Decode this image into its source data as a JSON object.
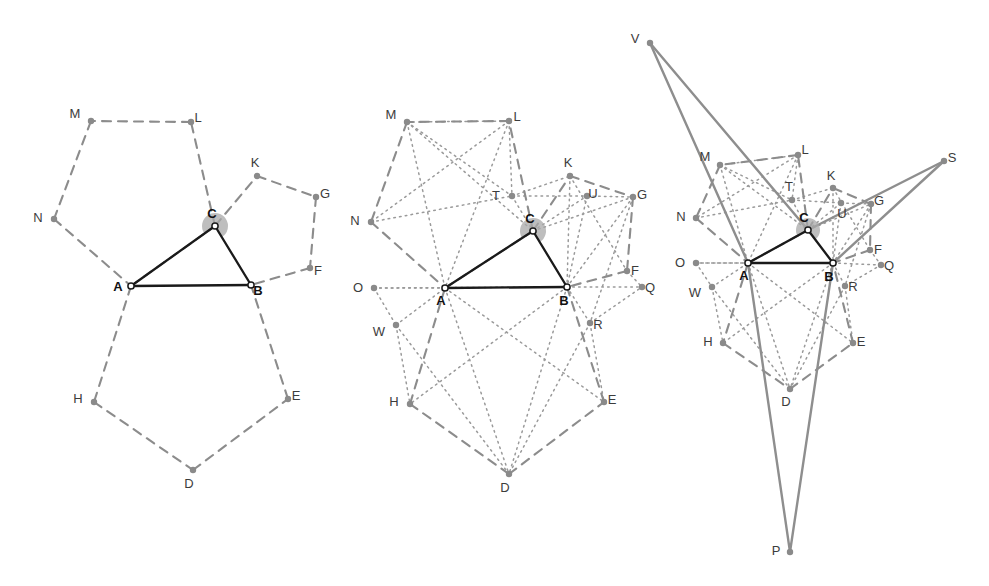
{
  "figure": {
    "background_color": "#ffffff",
    "colors": {
      "triangle_stroke": "#1a1a1a",
      "pentagon_dashed": "#8c8c8c",
      "dotted_line": "#9a9a9a",
      "solid_gray_line": "#8e8e8e",
      "vertex_fill": "#8a8a8a",
      "vertex_open_fill": "#ffffff",
      "angle_arc_fill": "#a8a8a8",
      "label_dark": "#111111",
      "label_gray": "#3c3c3c"
    },
    "line_styles": {
      "triangle": "solid-black-2.2px",
      "pentagon": "dashed-gray-2px",
      "diagonal": "dotted-gray-1.6px",
      "outer": "solid-gray-2.2px"
    }
  },
  "panels": [
    {
      "id": "panel-1",
      "name": "triangle-with-pentagons",
      "description": "Triangle ABC with regular pentagons erected outward on each side",
      "points": {
        "A": {
          "x": 131,
          "y": 286,
          "label": "A",
          "label_dx": -13,
          "label_dy": 5,
          "bold": true,
          "open": true
        },
        "B": {
          "x": 251,
          "y": 285,
          "label": "B",
          "label_dx": 7,
          "label_dy": 10,
          "bold": true,
          "open": true
        },
        "C": {
          "x": 215,
          "y": 226,
          "label": "C",
          "label_dx": -3,
          "label_dy": -8,
          "bold": true,
          "open": true
        },
        "D": {
          "x": 193,
          "y": 470,
          "label": "D",
          "label_dx": -4,
          "label_dy": 18,
          "bold": false,
          "open": false
        },
        "E": {
          "x": 288,
          "y": 399,
          "label": "E",
          "label_dx": 8,
          "label_dy": 1,
          "bold": false,
          "open": false
        },
        "F": {
          "x": 310,
          "y": 268,
          "label": "F",
          "label_dx": 8,
          "label_dy": 7,
          "bold": false,
          "open": false
        },
        "G": {
          "x": 316,
          "y": 197,
          "label": "G",
          "label_dx": 9,
          "label_dy": 1,
          "bold": false,
          "open": false
        },
        "H": {
          "x": 94,
          "y": 402,
          "label": "H",
          "label_dx": -16,
          "label_dy": 1,
          "bold": false,
          "open": false
        },
        "K": {
          "x": 257,
          "y": 176,
          "label": "K",
          "label_dx": -2,
          "label_dy": -9,
          "bold": false,
          "open": false
        },
        "L": {
          "x": 191,
          "y": 122,
          "label": "L",
          "label_dx": 7,
          "label_dy": 0,
          "bold": false,
          "open": false
        },
        "M": {
          "x": 91,
          "y": 121,
          "label": "M",
          "label_dx": -16,
          "label_dy": -3,
          "bold": false,
          "open": false
        },
        "N": {
          "x": 54,
          "y": 219,
          "label": "N",
          "label_dx": -16,
          "label_dy": 3,
          "bold": false,
          "open": false
        }
      },
      "triangle_edges": [
        [
          "A",
          "B"
        ],
        [
          "B",
          "C"
        ],
        [
          "C",
          "A"
        ]
      ],
      "dashed_paths": [
        [
          "A",
          "C",
          "L",
          "M",
          "N",
          "A"
        ],
        [
          "C",
          "K",
          "G",
          "F",
          "B"
        ],
        [
          "A",
          "H",
          "D",
          "E",
          "B"
        ]
      ],
      "dotted_paths": [],
      "solid_gray_paths": [],
      "angle_marks": [
        {
          "vertex": "C",
          "radius": 13
        }
      ]
    },
    {
      "id": "panel-2",
      "name": "pentagons-with-diagonals",
      "description": "Same construction with pentagon diagonals drawn as dotted lines, introducing points O, Q, R, T, U, W",
      "points": {
        "A": {
          "x": 445,
          "y": 288,
          "label": "A",
          "label_dx": -4,
          "label_dy": 17,
          "bold": true,
          "open": true
        },
        "B": {
          "x": 567,
          "y": 287,
          "label": "B",
          "label_dx": -3,
          "label_dy": 18,
          "bold": true,
          "open": true
        },
        "C": {
          "x": 533,
          "y": 231,
          "label": "C",
          "label_dx": -3,
          "label_dy": -8,
          "bold": true,
          "open": true
        },
        "D": {
          "x": 509,
          "y": 474,
          "label": "D",
          "label_dx": -4,
          "label_dy": 18,
          "bold": false,
          "open": false
        },
        "E": {
          "x": 604,
          "y": 402,
          "label": "E",
          "label_dx": 8,
          "label_dy": 2,
          "bold": false,
          "open": false
        },
        "F": {
          "x": 627,
          "y": 271,
          "label": "F",
          "label_dx": 8,
          "label_dy": 4,
          "bold": false,
          "open": false
        },
        "G": {
          "x": 633,
          "y": 197,
          "label": "G",
          "label_dx": 9,
          "label_dy": 2,
          "bold": false,
          "open": false
        },
        "H": {
          "x": 410,
          "y": 404,
          "label": "H",
          "label_dx": -16,
          "label_dy": 2,
          "bold": false,
          "open": false
        },
        "K": {
          "x": 570,
          "y": 176,
          "label": "K",
          "label_dx": -2,
          "label_dy": -9,
          "bold": false,
          "open": false
        },
        "L": {
          "x": 509,
          "y": 121,
          "label": "L",
          "label_dx": 8,
          "label_dy": 0,
          "bold": false,
          "open": false
        },
        "M": {
          "x": 407,
          "y": 122,
          "label": "M",
          "label_dx": -16,
          "label_dy": -3,
          "bold": false,
          "open": false
        },
        "N": {
          "x": 371,
          "y": 222,
          "label": "N",
          "label_dx": -16,
          "label_dy": 3,
          "bold": false,
          "open": false
        },
        "O": {
          "x": 374,
          "y": 288,
          "label": "O",
          "label_dx": -16,
          "label_dy": 4,
          "bold": false,
          "open": false
        },
        "Q": {
          "x": 642,
          "y": 287,
          "label": "Q",
          "label_dx": 8,
          "label_dy": 5,
          "bold": false,
          "open": false
        },
        "R": {
          "x": 590,
          "y": 323,
          "label": "R",
          "label_dx": 8,
          "label_dy": 6,
          "bold": false,
          "open": false
        },
        "T": {
          "x": 512,
          "y": 196,
          "label": "T",
          "label_dx": -16,
          "label_dy": 4,
          "bold": false,
          "open": false
        },
        "U": {
          "x": 587,
          "y": 196,
          "label": "U",
          "label_dx": 6,
          "label_dy": 2,
          "bold": false,
          "open": false
        },
        "W": {
          "x": 396,
          "y": 325,
          "label": "W",
          "label_dx": -17,
          "label_dy": 11,
          "bold": false,
          "open": false
        }
      },
      "triangle_edges": [
        [
          "A",
          "B"
        ],
        [
          "B",
          "C"
        ],
        [
          "C",
          "A"
        ]
      ],
      "dashed_paths": [
        [
          "A",
          "C",
          "L",
          "M",
          "N",
          "A"
        ],
        [
          "C",
          "K",
          "G",
          "F",
          "B"
        ],
        [
          "A",
          "H",
          "D",
          "E",
          "B"
        ]
      ],
      "dotted_paths": [
        [
          "M",
          "C"
        ],
        [
          "M",
          "A"
        ],
        [
          "L",
          "N"
        ],
        [
          "L",
          "A"
        ],
        [
          "M",
          "T"
        ],
        [
          "T",
          "U"
        ],
        [
          "T",
          "C"
        ],
        [
          "T",
          "K"
        ],
        [
          "C",
          "U"
        ],
        [
          "C",
          "G"
        ],
        [
          "K",
          "F"
        ],
        [
          "K",
          "B"
        ],
        [
          "U",
          "B"
        ],
        [
          "U",
          "G"
        ],
        [
          "G",
          "B"
        ],
        [
          "G",
          "R"
        ],
        [
          "F",
          "Q"
        ],
        [
          "B",
          "Q"
        ],
        [
          "B",
          "R"
        ],
        [
          "R",
          "Q"
        ],
        [
          "R",
          "E"
        ],
        [
          "R",
          "D"
        ],
        [
          "A",
          "O"
        ],
        [
          "O",
          "B"
        ],
        [
          "O",
          "W"
        ],
        [
          "W",
          "A"
        ],
        [
          "W",
          "H"
        ],
        [
          "W",
          "D"
        ],
        [
          "A",
          "D"
        ],
        [
          "A",
          "E"
        ],
        [
          "B",
          "D"
        ],
        [
          "B",
          "H"
        ],
        [
          "N",
          "T"
        ],
        [
          "L",
          "T"
        ],
        [
          "M",
          "L"
        ]
      ],
      "solid_gray_paths": [],
      "angle_marks": [
        {
          "vertex": "C",
          "radius": 13
        }
      ]
    },
    {
      "id": "panel-3",
      "name": "outer-napoleon-triangle",
      "description": "Full construction with apex points P, S, V joined to the triangle by solid gray lines",
      "points": {
        "A": {
          "x": 748,
          "y": 263,
          "label": "A",
          "label_dx": -4,
          "label_dy": 17,
          "bold": true,
          "open": true
        },
        "B": {
          "x": 833,
          "y": 263,
          "label": "B",
          "label_dx": -4,
          "label_dy": 18,
          "bold": true,
          "open": true
        },
        "C": {
          "x": 808,
          "y": 230,
          "label": "C",
          "label_dx": -4,
          "label_dy": -8,
          "bold": true,
          "open": true
        },
        "D": {
          "x": 790,
          "y": 389,
          "label": "D",
          "label_dx": -4,
          "label_dy": 17,
          "bold": false,
          "open": false
        },
        "E": {
          "x": 853,
          "y": 343,
          "label": "E",
          "label_dx": 8,
          "label_dy": 3,
          "bold": false,
          "open": false
        },
        "F": {
          "x": 870,
          "y": 250,
          "label": "F",
          "label_dx": 8,
          "label_dy": 4,
          "bold": false,
          "open": false
        },
        "G": {
          "x": 871,
          "y": 204,
          "label": "G",
          "label_dx": 8,
          "label_dy": 1,
          "bold": false,
          "open": false
        },
        "H": {
          "x": 723,
          "y": 343,
          "label": "H",
          "label_dx": -15,
          "label_dy": 3,
          "bold": false,
          "open": false
        },
        "K": {
          "x": 833,
          "y": 188,
          "label": "K",
          "label_dx": -2,
          "label_dy": -8,
          "bold": false,
          "open": false
        },
        "L": {
          "x": 798,
          "y": 155,
          "label": "L",
          "label_dx": 7,
          "label_dy": -1,
          "bold": false,
          "open": false
        },
        "M": {
          "x": 720,
          "y": 165,
          "label": "M",
          "label_dx": -15,
          "label_dy": -4,
          "bold": false,
          "open": false
        },
        "N": {
          "x": 696,
          "y": 218,
          "label": "N",
          "label_dx": -15,
          "label_dy": 3,
          "bold": false,
          "open": false
        },
        "O": {
          "x": 696,
          "y": 263,
          "label": "O",
          "label_dx": -16,
          "label_dy": 4,
          "bold": false,
          "open": false
        },
        "P": {
          "x": 790,
          "y": 552,
          "label": "P",
          "label_dx": -14,
          "label_dy": 3,
          "bold": false,
          "open": false
        },
        "Q": {
          "x": 881,
          "y": 265,
          "label": "Q",
          "label_dx": 8,
          "label_dy": 5,
          "bold": false,
          "open": false
        },
        "R": {
          "x": 845,
          "y": 286,
          "label": "R",
          "label_dx": 8,
          "label_dy": 5,
          "bold": false,
          "open": false
        },
        "S": {
          "x": 944,
          "y": 161,
          "label": "S",
          "label_dx": 8,
          "label_dy": 1,
          "bold": false,
          "open": false
        },
        "T": {
          "x": 792,
          "y": 200,
          "label": "T",
          "label_dx": -3,
          "label_dy": -9,
          "bold": false,
          "open": false
        },
        "U": {
          "x": 841,
          "y": 203,
          "label": "U",
          "label_dx": 1,
          "label_dy": 15,
          "bold": false,
          "open": false
        },
        "V": {
          "x": 650,
          "y": 43,
          "label": "V",
          "label_dx": -15,
          "label_dy": 0,
          "bold": false,
          "open": false
        },
        "W": {
          "x": 712,
          "y": 287,
          "label": "W",
          "label_dx": -17,
          "label_dy": 10,
          "bold": false,
          "open": false
        }
      },
      "triangle_edges": [
        [
          "A",
          "B"
        ],
        [
          "B",
          "C"
        ],
        [
          "C",
          "A"
        ]
      ],
      "dashed_paths": [
        [
          "A",
          "C",
          "L",
          "M",
          "N",
          "A"
        ],
        [
          "C",
          "K",
          "G",
          "F",
          "B"
        ],
        [
          "A",
          "H",
          "D",
          "E",
          "B"
        ]
      ],
      "dotted_paths": [
        [
          "M",
          "C"
        ],
        [
          "M",
          "A"
        ],
        [
          "L",
          "N"
        ],
        [
          "L",
          "A"
        ],
        [
          "M",
          "T"
        ],
        [
          "T",
          "U"
        ],
        [
          "T",
          "C"
        ],
        [
          "T",
          "K"
        ],
        [
          "C",
          "U"
        ],
        [
          "C",
          "G"
        ],
        [
          "K",
          "F"
        ],
        [
          "K",
          "B"
        ],
        [
          "U",
          "B"
        ],
        [
          "U",
          "G"
        ],
        [
          "G",
          "B"
        ],
        [
          "G",
          "R"
        ],
        [
          "F",
          "Q"
        ],
        [
          "B",
          "Q"
        ],
        [
          "B",
          "R"
        ],
        [
          "R",
          "Q"
        ],
        [
          "R",
          "E"
        ],
        [
          "R",
          "D"
        ],
        [
          "A",
          "O"
        ],
        [
          "O",
          "B"
        ],
        [
          "O",
          "W"
        ],
        [
          "W",
          "A"
        ],
        [
          "W",
          "H"
        ],
        [
          "W",
          "D"
        ],
        [
          "A",
          "D"
        ],
        [
          "A",
          "E"
        ],
        [
          "B",
          "D"
        ],
        [
          "B",
          "H"
        ],
        [
          "N",
          "T"
        ],
        [
          "L",
          "T"
        ],
        [
          "M",
          "L"
        ]
      ],
      "solid_gray_paths": [
        [
          "V",
          "A"
        ],
        [
          "V",
          "C"
        ],
        [
          "C",
          "S"
        ],
        [
          "B",
          "S"
        ],
        [
          "A",
          "P"
        ],
        [
          "B",
          "P"
        ]
      ],
      "angle_marks": [
        {
          "vertex": "C",
          "radius": 12
        }
      ]
    }
  ],
  "vertex_labels": [
    "A",
    "B",
    "C",
    "D",
    "E",
    "F",
    "G",
    "H",
    "K",
    "L",
    "M",
    "N",
    "O",
    "P",
    "Q",
    "R",
    "S",
    "T",
    "U",
    "V",
    "W"
  ]
}
